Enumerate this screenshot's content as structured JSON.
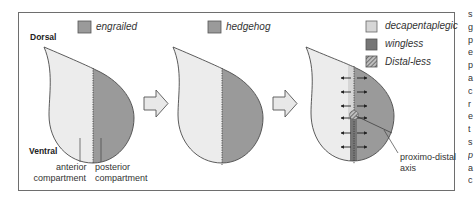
{
  "figure": {
    "orientation_labels": {
      "dorsal": "Dorsal",
      "ventral": "Ventral"
    },
    "panels": [
      {
        "id": "panel-1",
        "legend": [
          {
            "label": "engrailed",
            "swatch": "medium-grey",
            "color": "#9a9a9a"
          }
        ],
        "labels": {
          "anterior": [
            "anterior",
            "compartment"
          ],
          "posterior": [
            "posterior",
            "compartment"
          ]
        }
      },
      {
        "id": "panel-2",
        "legend": [
          {
            "label": "hedgehog",
            "swatch": "medium-grey",
            "color": "#9a9a9a"
          }
        ]
      },
      {
        "id": "panel-3",
        "legend": [
          {
            "label": "decapentaplegic",
            "swatch": "light-grey",
            "color": "#d6d6d6"
          },
          {
            "label": "wingless",
            "swatch": "dark-grey",
            "color": "#767676"
          },
          {
            "label": "Distal-less",
            "swatch": "hatched",
            "color": "#8a8a8a"
          }
        ],
        "labels": {
          "axis": [
            "proximo-distal",
            "axis"
          ]
        }
      }
    ],
    "arrows": [
      {
        "from": "panel-1",
        "to": "panel-2"
      },
      {
        "from": "panel-2",
        "to": "panel-3"
      }
    ],
    "colors": {
      "anterior": "#ececec",
      "posterior": "#9a9a9a",
      "outline": "#4a4a4a",
      "frame": "#6e6e6e"
    }
  },
  "adjacent_text_column": [
    "s",
    "g",
    "p",
    "e",
    "p",
    "a",
    "c",
    "r",
    "e",
    "t",
    "s",
    "p",
    "a",
    "c"
  ]
}
